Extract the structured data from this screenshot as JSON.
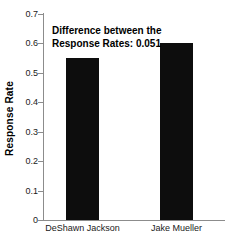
{
  "chart_data": {
    "type": "bar",
    "title": "",
    "xlabel": "",
    "ylabel": "Response Rate",
    "categories": [
      "DeShawn Jackson",
      "Jake Mueller"
    ],
    "values": [
      0.55,
      0.601
    ],
    "ylim": [
      0,
      0.7
    ],
    "yticks": [
      "0",
      "0.1",
      "0.2",
      "0.3",
      "0.4",
      "0.5",
      "0.6",
      "0.7"
    ],
    "ytick_values": [
      0,
      0.1,
      0.2,
      0.3,
      0.4,
      0.5,
      0.6,
      0.7
    ],
    "grid": false,
    "legend": null,
    "bar_color": "#0d0d0d",
    "axis_color": "#8c8c8c",
    "background": "#ffffff",
    "annotations": [
      {
        "line1": "Difference between the",
        "line2": "Response Rates: 0.051",
        "value": 0.051
      }
    ]
  }
}
